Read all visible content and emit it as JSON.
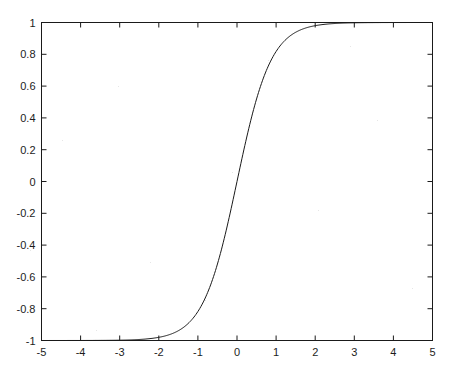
{
  "chart_title": "tanh sigmoid",
  "axes": {
    "frame_color": "#1a1a1a",
    "curve_color": "#1a1a1a",
    "background": "#ffffff",
    "tick_direction": "in"
  },
  "chart_data": {
    "type": "line",
    "title": "tanh sigmoid",
    "xlabel": "",
    "ylabel": "",
    "xlim": [
      -5,
      5
    ],
    "ylim": [
      -1,
      1
    ],
    "grid": false,
    "legend": null,
    "xticks": [
      -5,
      -4,
      -3,
      -2,
      -1,
      0,
      1,
      2,
      3,
      4,
      5
    ],
    "xtick_labels": [
      "-5",
      "-4",
      "-3",
      "-2",
      "-1",
      "0",
      "1",
      "2",
      "3",
      "4",
      "5"
    ],
    "yticks": [
      -1,
      -0.8,
      -0.6,
      -0.4,
      -0.2,
      0,
      0.2,
      0.4,
      0.6,
      0.8,
      1
    ],
    "ytick_labels": [
      "-1",
      "-0.8",
      "-0.6",
      "-0.4",
      "-0.2",
      "0",
      "0.2",
      "0.4",
      "0.6",
      "0.8",
      "1"
    ],
    "series": [
      {
        "name": "tanh sigmoid",
        "color": "#1a1a1a",
        "linewidth": 1,
        "x": [
          -5.0,
          -4.75,
          -4.5,
          -4.25,
          -4.0,
          -3.75,
          -3.5,
          -3.25,
          -3.0,
          -2.75,
          -2.5,
          -2.25,
          -2.0,
          -1.75,
          -1.5,
          -1.25,
          -1.0,
          -0.75,
          -0.5,
          -0.25,
          0.0,
          0.25,
          0.5,
          0.75,
          1.0,
          1.25,
          1.5,
          1.75,
          2.0,
          2.25,
          2.5,
          2.75,
          3.0,
          3.25,
          3.5,
          3.75,
          4.0,
          4.25,
          4.5,
          4.75,
          5.0
        ],
        "y": [
          -1.0,
          -1.0,
          -0.9999,
          -0.9998,
          -0.9997,
          -0.9995,
          -0.9992,
          -0.9987,
          -0.9979,
          -0.9967,
          -0.9947,
          -0.9916,
          -0.9867,
          -0.979,
          -0.9669,
          -0.9481,
          -0.9195,
          -0.8768,
          -0.8151,
          -0.7293,
          -0.0,
          0.7293,
          0.8151,
          0.8768,
          0.9195,
          0.9481,
          0.9669,
          0.979,
          0.9867,
          0.9916,
          0.9947,
          0.9967,
          0.9979,
          0.9987,
          0.9992,
          0.9995,
          0.9997,
          0.9998,
          0.9999,
          1.0,
          1.0
        ],
        "formula": "tanh(1.15*x)"
      }
    ]
  }
}
